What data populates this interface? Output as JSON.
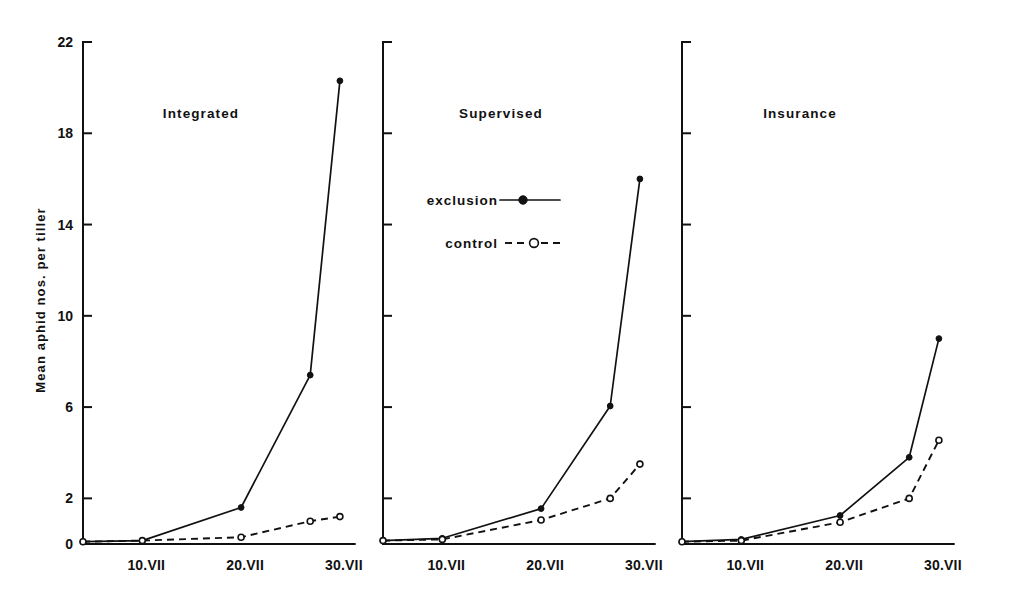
{
  "figure": {
    "y_axis_title": "Mean aphid nos. per tiller",
    "y_ticks": [
      "0",
      "2",
      "6",
      "10",
      "14",
      "18",
      "22"
    ],
    "x_ticks": [
      "10.VII",
      "20.VII",
      "30.VII"
    ],
    "legend": {
      "exclusion_label": "exclusion",
      "control_label": "control"
    },
    "panels": [
      {
        "title": "Integrated"
      },
      {
        "title": "Supervised"
      },
      {
        "title": "Insurance"
      }
    ]
  },
  "chart_data": {
    "type": "line",
    "title": "",
    "xlabel": "",
    "ylabel": "Mean aphid nos. per tiller",
    "ylim": [
      0,
      22
    ],
    "yticks": [
      0,
      2,
      6,
      10,
      14,
      18,
      22
    ],
    "grid": false,
    "legend_position": "center-left-of-middle-panel",
    "legend_entries": [
      "exclusion",
      "control"
    ],
    "x_tick_labels": [
      "10.VII",
      "20.VII",
      "30.VII"
    ],
    "x_tick_days": [
      10,
      20,
      30
    ],
    "x_data_days": [
      4,
      10,
      20,
      24,
      27,
      30
    ],
    "panels": [
      {
        "title": "Integrated",
        "series": [
          {
            "name": "exclusion",
            "style": "solid-filled-circle",
            "x": [
              4,
              10,
              20,
              27,
              30
            ],
            "values": [
              0.1,
              0.15,
              1.6,
              7.4,
              20.3
            ]
          },
          {
            "name": "control",
            "style": "dashed-open-circle",
            "x": [
              4,
              10,
              20,
              27,
              30
            ],
            "values": [
              0.1,
              0.15,
              0.3,
              1.0,
              1.2
            ]
          }
        ]
      },
      {
        "title": "Supervised",
        "series": [
          {
            "name": "exclusion",
            "style": "solid-filled-circle",
            "x": [
              4,
              10,
              20,
              27,
              30
            ],
            "values": [
              0.15,
              0.25,
              1.55,
              6.05,
              16.0
            ]
          },
          {
            "name": "control",
            "style": "dashed-open-circle",
            "x": [
              4,
              10,
              20,
              27,
              30
            ],
            "values": [
              0.15,
              0.2,
              1.05,
              2.0,
              3.5
            ]
          }
        ]
      },
      {
        "title": "Insurance",
        "series": [
          {
            "name": "exclusion",
            "style": "solid-filled-circle",
            "x": [
              4,
              10,
              20,
              27,
              30
            ],
            "values": [
              0.1,
              0.2,
              1.25,
              3.8,
              9.0
            ]
          },
          {
            "name": "control",
            "style": "dashed-open-circle",
            "x": [
              4,
              10,
              20,
              27,
              30
            ],
            "values": [
              0.1,
              0.15,
              0.95,
              2.0,
              4.55
            ]
          }
        ]
      }
    ]
  },
  "colors": {
    "ink": "#111111",
    "background": "#ffffff"
  }
}
